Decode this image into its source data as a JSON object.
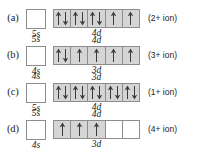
{
  "figure": {
    "rows": [
      {
        "label": "(a)",
        "ion": "(2+ ion)",
        "s_orbital": {
          "name": "5s",
          "label_position": "below",
          "electrons": 0
        },
        "d_orbital": {
          "name": "4d",
          "label_position": "below",
          "boxes": [
            "up-down",
            "up-down",
            "up-down",
            "up",
            "up"
          ]
        }
      },
      {
        "label": "(b)",
        "ion": "(3+ ion)",
        "s_orbital": {
          "name": "4s",
          "label_position": "below",
          "electrons": 0,
          "secondary_label": "5s",
          "secondary_position": "above"
        },
        "d_orbital": {
          "name": "3d",
          "label_position": "below",
          "secondary_label": "4d",
          "secondary_position": "above",
          "boxes": [
            "up-down",
            "up",
            "up",
            "up",
            "up"
          ]
        }
      },
      {
        "label": "(c)",
        "ion": "(1+ ion)",
        "s_orbital": {
          "name": "5s",
          "label_position": "below",
          "electrons": 0,
          "secondary_label": "4s",
          "secondary_position": "above"
        },
        "d_orbital": {
          "name": "4d",
          "label_position": "below",
          "secondary_label": "3d",
          "secondary_position": "above",
          "boxes": [
            "up-down",
            "up-down",
            "up-down",
            "up-down",
            "up-down"
          ]
        }
      },
      {
        "label": "(d)",
        "ion": "(4+ ion)",
        "s_orbital": {
          "name": "4s",
          "label_position": "below",
          "electrons": 0,
          "secondary_label": "5s",
          "secondary_position": "above"
        },
        "d_orbital": {
          "name": "3d",
          "label_position": "below",
          "secondary_label": "4d",
          "secondary_position": "above",
          "boxes": [
            "up",
            "up",
            "up",
            "empty",
            "empty"
          ]
        }
      }
    ],
    "colors": {
      "filled_box_background": "#d5d5d5",
      "empty_box_background": "#ffffff",
      "box_border": "#8d8d8d",
      "arrow": "#3a3a3a",
      "text": "#1a1a1a",
      "page_background": "#ffffff"
    }
  }
}
